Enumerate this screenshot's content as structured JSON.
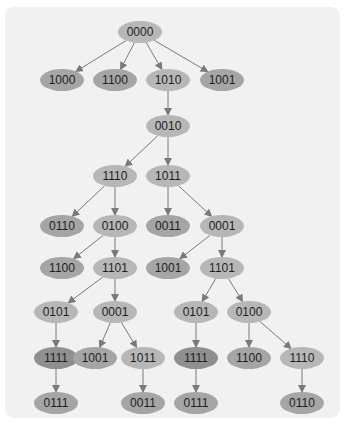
{
  "diagram": {
    "colors": {
      "background": "#ffffff",
      "panel": "#f1f1f1",
      "edge": "#7a7a7a",
      "node_internal": "#b7b7b7",
      "node_leaf": "#a5a5a5",
      "node_highlight": "#8f8f8f",
      "text": "#1e1e1e"
    },
    "node_size": {
      "rx": 22,
      "ry": 11
    },
    "nodes": [
      {
        "id": "n0",
        "label": "0000",
        "x": 140,
        "y": 32,
        "kind": "internal"
      },
      {
        "id": "n1",
        "label": "1000",
        "x": 62,
        "y": 80,
        "kind": "leaf"
      },
      {
        "id": "n2",
        "label": "1100",
        "x": 115,
        "y": 80,
        "kind": "leaf"
      },
      {
        "id": "n3",
        "label": "1010",
        "x": 168,
        "y": 80,
        "kind": "internal"
      },
      {
        "id": "n4",
        "label": "1001",
        "x": 222,
        "y": 80,
        "kind": "leaf"
      },
      {
        "id": "n5",
        "label": "0010",
        "x": 168,
        "y": 126,
        "kind": "internal"
      },
      {
        "id": "n6",
        "label": "1110",
        "x": 115,
        "y": 176,
        "kind": "internal"
      },
      {
        "id": "n7",
        "label": "1011",
        "x": 168,
        "y": 176,
        "kind": "internal"
      },
      {
        "id": "n8",
        "label": "0110",
        "x": 62,
        "y": 226,
        "kind": "leaf"
      },
      {
        "id": "n9",
        "label": "0100",
        "x": 115,
        "y": 226,
        "kind": "internal"
      },
      {
        "id": "n10",
        "label": "0011",
        "x": 168,
        "y": 226,
        "kind": "leaf"
      },
      {
        "id": "n11",
        "label": "0001",
        "x": 222,
        "y": 226,
        "kind": "internal"
      },
      {
        "id": "n12",
        "label": "1100",
        "x": 62,
        "y": 268,
        "kind": "leaf"
      },
      {
        "id": "n13",
        "label": "1101",
        "x": 115,
        "y": 268,
        "kind": "internal"
      },
      {
        "id": "n14",
        "label": "1001",
        "x": 168,
        "y": 268,
        "kind": "leaf"
      },
      {
        "id": "n15",
        "label": "1101",
        "x": 222,
        "y": 268,
        "kind": "internal"
      },
      {
        "id": "n16",
        "label": "0101",
        "x": 56,
        "y": 312,
        "kind": "internal"
      },
      {
        "id": "n17",
        "label": "0001",
        "x": 115,
        "y": 312,
        "kind": "internal"
      },
      {
        "id": "n18",
        "label": "0101",
        "x": 196,
        "y": 312,
        "kind": "internal"
      },
      {
        "id": "n19",
        "label": "0100",
        "x": 249,
        "y": 312,
        "kind": "internal"
      },
      {
        "id": "n20",
        "label": "1111",
        "x": 56,
        "y": 358,
        "kind": "highlight"
      },
      {
        "id": "n21",
        "label": "1001",
        "x": 95,
        "y": 358,
        "kind": "leaf"
      },
      {
        "id": "n22",
        "label": "1011",
        "x": 143,
        "y": 358,
        "kind": "internal"
      },
      {
        "id": "n23",
        "label": "1111",
        "x": 196,
        "y": 358,
        "kind": "highlight"
      },
      {
        "id": "n24",
        "label": "1100",
        "x": 249,
        "y": 358,
        "kind": "leaf"
      },
      {
        "id": "n25",
        "label": "1110",
        "x": 302,
        "y": 358,
        "kind": "internal"
      },
      {
        "id": "n26",
        "label": "0111",
        "x": 56,
        "y": 403,
        "kind": "leaf"
      },
      {
        "id": "n27",
        "label": "0011",
        "x": 143,
        "y": 403,
        "kind": "leaf"
      },
      {
        "id": "n28",
        "label": "0111",
        "x": 196,
        "y": 403,
        "kind": "leaf"
      },
      {
        "id": "n29",
        "label": "0110",
        "x": 302,
        "y": 403,
        "kind": "leaf"
      }
    ],
    "edges": [
      [
        "n0",
        "n1"
      ],
      [
        "n0",
        "n2"
      ],
      [
        "n0",
        "n3"
      ],
      [
        "n0",
        "n4"
      ],
      [
        "n3",
        "n5"
      ],
      [
        "n5",
        "n6"
      ],
      [
        "n5",
        "n7"
      ],
      [
        "n6",
        "n8"
      ],
      [
        "n6",
        "n9"
      ],
      [
        "n7",
        "n10"
      ],
      [
        "n7",
        "n11"
      ],
      [
        "n9",
        "n12"
      ],
      [
        "n9",
        "n13"
      ],
      [
        "n11",
        "n14"
      ],
      [
        "n11",
        "n15"
      ],
      [
        "n13",
        "n16"
      ],
      [
        "n13",
        "n17"
      ],
      [
        "n15",
        "n18"
      ],
      [
        "n15",
        "n19"
      ],
      [
        "n16",
        "n20"
      ],
      [
        "n17",
        "n21"
      ],
      [
        "n17",
        "n22"
      ],
      [
        "n18",
        "n23"
      ],
      [
        "n19",
        "n24"
      ],
      [
        "n19",
        "n25"
      ],
      [
        "n20",
        "n26"
      ],
      [
        "n22",
        "n27"
      ],
      [
        "n23",
        "n28"
      ],
      [
        "n25",
        "n29"
      ]
    ]
  }
}
